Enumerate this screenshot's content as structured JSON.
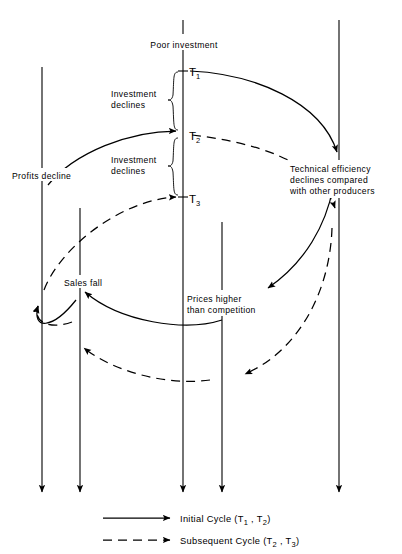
{
  "figure": {
    "title_nodes": {
      "poor_investment": "Poor investment",
      "profits_decline": "Profits decline",
      "sales_fall": "Sales fall",
      "prices_higher_line1": "Prices higher",
      "prices_higher_line2": "than competition",
      "technical_line1": "Technical efficiency",
      "technical_line2": "declines compared",
      "technical_line3": "with other producers"
    },
    "brace_labels": {
      "upper_line1": "Investment",
      "upper_line2": "declines",
      "lower_line1": "Investment",
      "lower_line2": "declines"
    },
    "time_marks": [
      {
        "base": "T",
        "sub": "1"
      },
      {
        "base": "T",
        "sub": "2"
      },
      {
        "base": "T",
        "sub": "3"
      }
    ],
    "legend": [
      {
        "style": "solid",
        "text_main": "Initial Cycle (",
        "t_a_base": "T",
        "t_a_sub": "1",
        "sep": " , ",
        "t_b_base": "T",
        "t_b_sub": "2",
        "text_end": ")"
      },
      {
        "style": "dashed",
        "text_main": "Subsequent Cycle (",
        "t_a_base": "T",
        "t_a_sub": "2",
        "sep": " , ",
        "t_b_base": "T",
        "t_b_sub": "3",
        "text_end": ")"
      }
    ],
    "colors": {
      "ink": "#000000",
      "paper": "#ffffff"
    }
  }
}
